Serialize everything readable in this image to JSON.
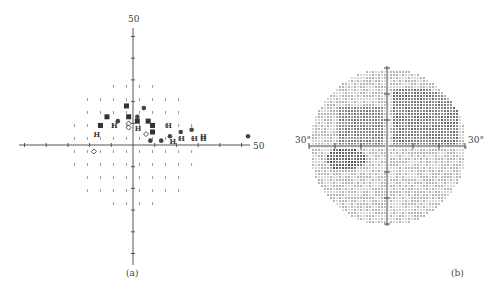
{
  "figure": {
    "panels": [
      {
        "id": "a",
        "caption": "(a)"
      },
      {
        "id": "b",
        "caption": "(b)"
      }
    ]
  },
  "chart_data": [
    {
      "type": "scatter",
      "title": "",
      "caption": "(a)",
      "xlabel": "",
      "ylabel": "",
      "axis_end_labels": {
        "x_right": "50",
        "y_top": "50"
      },
      "xlim": [
        -50,
        50
      ],
      "ylim": [
        -50,
        50
      ],
      "tick_step": 10,
      "grid": false,
      "legend": null,
      "description": "Visual field test points; symbols indicate sensitivity loss severity (small dot = normal, diamond = mild, circle = moderate, H = severe, filled square = absolute)",
      "series": [
        {
          "name": "absolute-defect-square",
          "points": [
            [
              -3,
              18
            ],
            [
              -12,
              13
            ],
            [
              -15,
              9
            ],
            [
              -2,
              13
            ],
            [
              2,
              11
            ],
            [
              7,
              11
            ],
            [
              9,
              9
            ],
            [
              9,
              6
            ]
          ]
        },
        {
          "name": "severe-H",
          "points": [
            [
              -9,
              9
            ],
            [
              -17,
              5
            ],
            [
              2,
              8
            ],
            [
              16,
              9
            ],
            [
              32,
              3
            ],
            [
              32,
              4
            ],
            [
              28,
              3
            ],
            [
              18,
              2
            ],
            [
              22,
              3
            ]
          ]
        },
        {
          "name": "moderate-circle",
          "points": [
            [
              5,
              17
            ],
            [
              -7,
              11
            ],
            [
              2,
              13
            ],
            [
              17,
              4
            ],
            [
              22,
              6
            ],
            [
              27,
              7
            ],
            [
              8,
              2
            ],
            [
              13,
              2
            ],
            [
              53,
              4
            ]
          ]
        },
        {
          "name": "mild-diamond",
          "points": [
            [
              -2,
              10
            ],
            [
              -2,
              8
            ],
            [
              6,
              5
            ],
            [
              -18,
              -3
            ]
          ]
        }
      ]
    },
    {
      "type": "heatmap",
      "title": "",
      "caption": "(b)",
      "axis_labels": {
        "left": "30°",
        "right": "30°"
      },
      "xlim": [
        -30,
        30
      ],
      "ylim": [
        -30,
        30
      ],
      "description": "Grayscale visual field map; dark regions = scotomas in upper hemifield and a small inferior-nasal patch"
    }
  ]
}
